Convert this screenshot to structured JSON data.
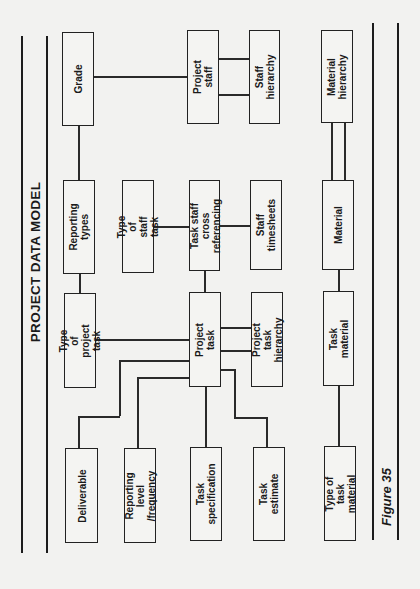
{
  "title": "PROJECT DATA MODEL",
  "caption": "Figure 35",
  "orientation": "rotated -90deg (landscape page printed sideways)",
  "entities": {
    "grade": "Grade",
    "project_staff": "Project staff",
    "staff_hierarchy": "Staff hierarchy",
    "material_hierarchy": "Material\nhierarchy",
    "reporting_types": "Reporting types",
    "type_of_staff_task": "Type of staff task",
    "task_staff_xref": "Task staff\ncross referencing",
    "staff_timesheets": "Staff timesheets",
    "material": "Material",
    "type_of_project_task": "Type of\nproject task",
    "project_task": "Project task",
    "project_task_hierarchy": "Project task\nhierarchy",
    "task_material": "Task material",
    "deliverable": "Deliverable",
    "reporting_level": "Reporting level\n/frequency",
    "task_specification": "Task specification",
    "task_estimate": "Task estimate",
    "type_of_task_material": "Type of task\nmaterial"
  },
  "relationships": [
    [
      "Grade",
      "Project staff"
    ],
    [
      "Grade",
      "Reporting types"
    ],
    [
      "Project staff",
      "Staff hierarchy"
    ],
    [
      "Project staff",
      "Staff hierarchy"
    ],
    [
      "Reporting types",
      "Type of project task"
    ],
    [
      "Type of staff task",
      "Task staff cross referencing"
    ],
    [
      "Task staff cross referencing",
      "Staff timesheets"
    ],
    [
      "Task staff cross referencing",
      "Project task"
    ],
    [
      "Type of project task",
      "Project task"
    ],
    [
      "Project task",
      "Project task hierarchy"
    ],
    [
      "Project task",
      "Project task hierarchy"
    ],
    [
      "Project task",
      "Deliverable"
    ],
    [
      "Project task",
      "Reporting level /frequency"
    ],
    [
      "Project task",
      "Task specification"
    ],
    [
      "Project task",
      "Task estimate"
    ],
    [
      "Material hierarchy",
      "Material"
    ],
    [
      "Material hierarchy",
      "Material"
    ],
    [
      "Material",
      "Task material"
    ],
    [
      "Task material",
      "Type of task material"
    ]
  ]
}
